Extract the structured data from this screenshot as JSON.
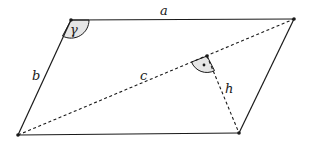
{
  "diagram": {
    "type": "parallelogram",
    "colors": {
      "stroke": "#1a1a1a",
      "angle_fill": "#e6e6e6",
      "background": "#ffffff"
    },
    "vertices": {
      "top_left": [
        71,
        20
      ],
      "top_right": [
        294,
        19
      ],
      "bottom_right": [
        239,
        133
      ],
      "bottom_left": [
        18,
        135
      ]
    },
    "foot_of_height": [
      207,
      56
    ],
    "labels": {
      "side_top": "a",
      "side_left": "b",
      "diagonal": "c",
      "height": "h",
      "angle": "γ"
    }
  }
}
